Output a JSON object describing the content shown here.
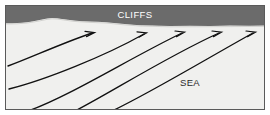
{
  "diagram": {
    "type": "wave-refraction-coastal-diagram",
    "frame": {
      "border_color": "#5a5a5a",
      "background_color": "#ffffff",
      "x": 5,
      "y": 5,
      "width": 260,
      "height": 105
    },
    "regions": [
      {
        "name": "cliffs",
        "label": "CLIFFS",
        "fill_color": "#6b6b6b",
        "label_color": "#ffffff",
        "label_x": 135,
        "label_y": 14,
        "font_size": 9.5
      },
      {
        "name": "sea",
        "label": "SEA",
        "fill_color": "#f0f0ee",
        "label_color": "#2b2b2b",
        "label_x": 190,
        "label_y": 83,
        "font_size": 9.5
      }
    ],
    "shoreline": {
      "name": "cliff-base-shoreline",
      "stroke_color": "#6b6b6b",
      "description": "irregular wavy boundary between cliff band and sea, with a rounded bump on the left half"
    },
    "waves": {
      "name": "wave-crest-orthogonals",
      "stroke_color": "#111111",
      "stroke_width": 1.3,
      "count": 5,
      "arrowhead": "open-thin-v",
      "paths": [
        {
          "id": "wave-1",
          "d": "M 8 66 C 30 58, 60 44, 92 33"
        },
        {
          "id": "wave-2",
          "d": "M 9 89 C 45 80, 105 56, 144 34"
        },
        {
          "id": "wave-3",
          "d": "M 28 110 C 70 96, 130 58, 182 33"
        },
        {
          "id": "wave-4",
          "d": "M 75 110 C 110 92, 168 56, 219 33"
        },
        {
          "id": "wave-5",
          "d": "M 112 110 C 150 92, 208 58, 253 33"
        }
      ]
    }
  }
}
